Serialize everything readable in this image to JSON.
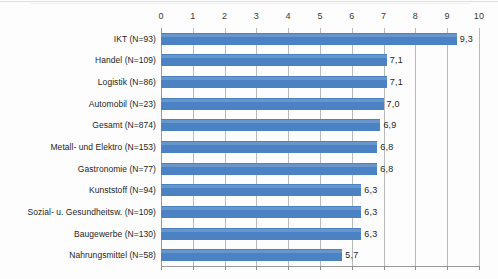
{
  "chart_data": {
    "type": "bar",
    "orientation": "horizontal",
    "title": "",
    "subtitle": "",
    "xlabel": "",
    "ylabel": "",
    "xlim": [
      0,
      10
    ],
    "xticks": [
      "0",
      "1",
      "2",
      "3",
      "4",
      "5",
      "6",
      "7",
      "8",
      "9",
      "10"
    ],
    "grid": true,
    "legend": false,
    "decimal_separator": ",",
    "bar_color": "#4a82c4",
    "gridline_color": "#b9b9b9",
    "axis_color": "#9a9a9a",
    "categories": [
      "IKT (N=93)",
      "Handel (N=109)",
      "Logistik (N=86)",
      "Automobil (N=23)",
      "Gesamt (N=874)",
      "Metall- und Elektro (N=153)",
      "Gastronomie (N=77)",
      "Kunststoff (N=94)",
      "Sozial- u. Gesundheitsw. (N=109)",
      "Baugewerbe (N=130)",
      "Nahrungsmittel (N=58)"
    ],
    "values": [
      9.3,
      7.1,
      7.1,
      7.0,
      6.9,
      6.8,
      6.8,
      6.3,
      6.3,
      6.3,
      5.7
    ],
    "value_labels": [
      "9,3",
      "7,1",
      "7,1",
      "7,0",
      "6,9",
      "6,8",
      "6,8",
      "6,3",
      "6,3",
      "6,3",
      "5,7"
    ]
  }
}
